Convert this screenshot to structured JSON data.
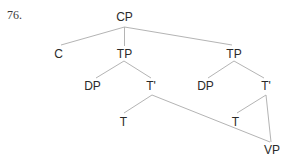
{
  "example": {
    "number": "76."
  },
  "tree": {
    "nodes": {
      "cp": {
        "label": "CP",
        "x": 124.5,
        "y": 11
      },
      "c": {
        "label": "C",
        "x": 58.5,
        "y": 48
      },
      "tp_left": {
        "label": "TP",
        "x": 124.5,
        "y": 48
      },
      "tp_right": {
        "label": "TP",
        "x": 234,
        "y": 48
      },
      "dp_left": {
        "label": "DP",
        "x": 92.5,
        "y": 80
      },
      "tbar_left": {
        "label": "T'",
        "x": 151,
        "y": 80
      },
      "dp_right": {
        "label": "DP",
        "x": 205.5,
        "y": 80
      },
      "tbar_right": {
        "label": "T'",
        "x": 266,
        "y": 80
      },
      "t_left": {
        "label": "T",
        "x": 123.5,
        "y": 116
      },
      "t_right": {
        "label": "T",
        "x": 235.5,
        "y": 116
      },
      "vp": {
        "label": "VP",
        "x": 272,
        "y": 144
      }
    },
    "edges": [
      {
        "from": "cp",
        "to": "c"
      },
      {
        "from": "cp",
        "to": "tp_left"
      },
      {
        "from": "cp",
        "to": "tp_right"
      },
      {
        "from": "tp_left",
        "to": "dp_left"
      },
      {
        "from": "tp_left",
        "to": "tbar_left"
      },
      {
        "from": "tp_right",
        "to": "dp_right"
      },
      {
        "from": "tp_right",
        "to": "tbar_right"
      },
      {
        "from": "tbar_left",
        "to": "t_left"
      },
      {
        "from": "tbar_left",
        "to": "vp"
      },
      {
        "from": "tbar_right",
        "to": "t_right"
      },
      {
        "from": "tbar_right",
        "to": "vp"
      }
    ],
    "line_color": "#b4b4b4",
    "text_color": "#2a2a2a"
  }
}
